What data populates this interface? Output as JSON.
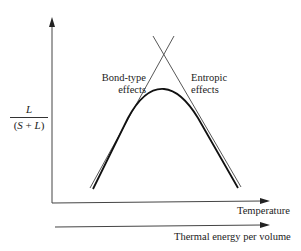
{
  "diagram": {
    "y_axis_label": {
      "numerator": "L",
      "denominator_open": "(",
      "denominator_s": "S",
      "denominator_plus": " + ",
      "denominator_l": "L",
      "denominator_close": ")"
    },
    "x_axis_labels": {
      "primary": "Temperature",
      "secondary": "Thermal energy per volume"
    },
    "annotations": {
      "left_line_line1": "Bond-type",
      "left_line_line2": "effects",
      "right_line_line1": "Entropic",
      "right_line_line2": "effects"
    },
    "colors": {
      "line": "#333333",
      "curve": "#111111",
      "background": "#ffffff"
    }
  }
}
